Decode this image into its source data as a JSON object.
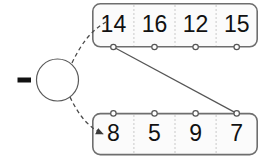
{
  "diagram": {
    "colors": {
      "box_fill": "#fbfbfb",
      "box_stroke": "#6e6e6e",
      "divider": "#c9c9c9",
      "line": "#555555",
      "text": "#111111"
    },
    "operator": {
      "symbol": "−",
      "name": "minus-operator",
      "cx": 57.5,
      "cy": 80,
      "r": 21
    },
    "top_array": {
      "name": "top-array",
      "x": 92,
      "y": 3,
      "width": 166,
      "height": 44,
      "cells": [
        {
          "value": "14"
        },
        {
          "value": "16"
        },
        {
          "value": "12"
        },
        {
          "value": "15"
        }
      ]
    },
    "bottom_array": {
      "name": "bottom-array",
      "x": 92,
      "y": 113,
      "width": 166,
      "height": 42,
      "cells": [
        {
          "value": "8"
        },
        {
          "value": "5"
        },
        {
          "value": "9"
        },
        {
          "value": "7"
        }
      ]
    },
    "connector": {
      "name": "cross-link",
      "from": "top-node-0",
      "to": "bottom-node-3"
    }
  }
}
